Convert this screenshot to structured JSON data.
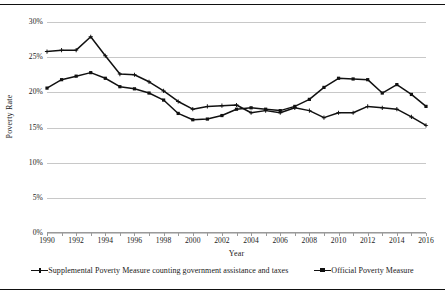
{
  "chart_data": {
    "type": "line",
    "title": "",
    "xlabel": "Year",
    "ylabel": "Poverty Rate",
    "ylim": [
      0,
      30
    ],
    "xlim": [
      1990,
      2016
    ],
    "grid": true,
    "legend_position": "bottom",
    "y_ticks": [
      "0%",
      "5%",
      "10%",
      "15%",
      "20%",
      "25%",
      "30%"
    ],
    "y_tick_values": [
      0,
      5,
      10,
      15,
      20,
      25,
      30
    ],
    "x_tick_labels": [
      "1990",
      "1992",
      "1994",
      "1996",
      "1998",
      "2000",
      "2002",
      "2004",
      "2006",
      "2008",
      "2010",
      "2012",
      "2014",
      "2016"
    ],
    "x_tick_values": [
      1990,
      1992,
      1994,
      1996,
      1998,
      2000,
      2002,
      2004,
      2006,
      2008,
      2010,
      2012,
      2014,
      2016
    ],
    "x": [
      1990,
      1991,
      1992,
      1993,
      1994,
      1995,
      1996,
      1997,
      1998,
      1999,
      2000,
      2001,
      2002,
      2003,
      2004,
      2005,
      2006,
      2007,
      2008,
      2009,
      2010,
      2011,
      2012,
      2013,
      2014,
      2015,
      2016
    ],
    "series": [
      {
        "name": "Supplemental Poverty Measure counting government assistance and taxes",
        "marker": "cross",
        "color": "#111111",
        "values": [
          25.8,
          26.0,
          26.0,
          27.9,
          25.2,
          22.6,
          22.5,
          21.5,
          20.2,
          18.7,
          17.6,
          18.0,
          18.1,
          18.2,
          17.1,
          17.4,
          17.1,
          17.8,
          17.4,
          16.4,
          17.1,
          17.1,
          18.0,
          17.8,
          17.6,
          16.5,
          15.3
        ]
      },
      {
        "name": "Official Poverty Measure",
        "marker": "square",
        "color": "#111111",
        "values": [
          20.6,
          21.8,
          22.3,
          22.8,
          22.0,
          20.8,
          20.5,
          19.9,
          18.9,
          17.0,
          16.1,
          16.2,
          16.7,
          17.6,
          17.8,
          17.6,
          17.4,
          18.0,
          19.0,
          20.7,
          22.0,
          21.9,
          21.8,
          19.9,
          21.1,
          19.7,
          18.0
        ]
      }
    ]
  },
  "axis_titles": {
    "x": "Year",
    "y": "Poverty Rate"
  },
  "legend": {
    "items": [
      {
        "label": "Supplemental Poverty Measure counting government assistance and taxes",
        "marker": "cross"
      },
      {
        "label": "Official Poverty Measure",
        "marker": "square"
      }
    ]
  }
}
